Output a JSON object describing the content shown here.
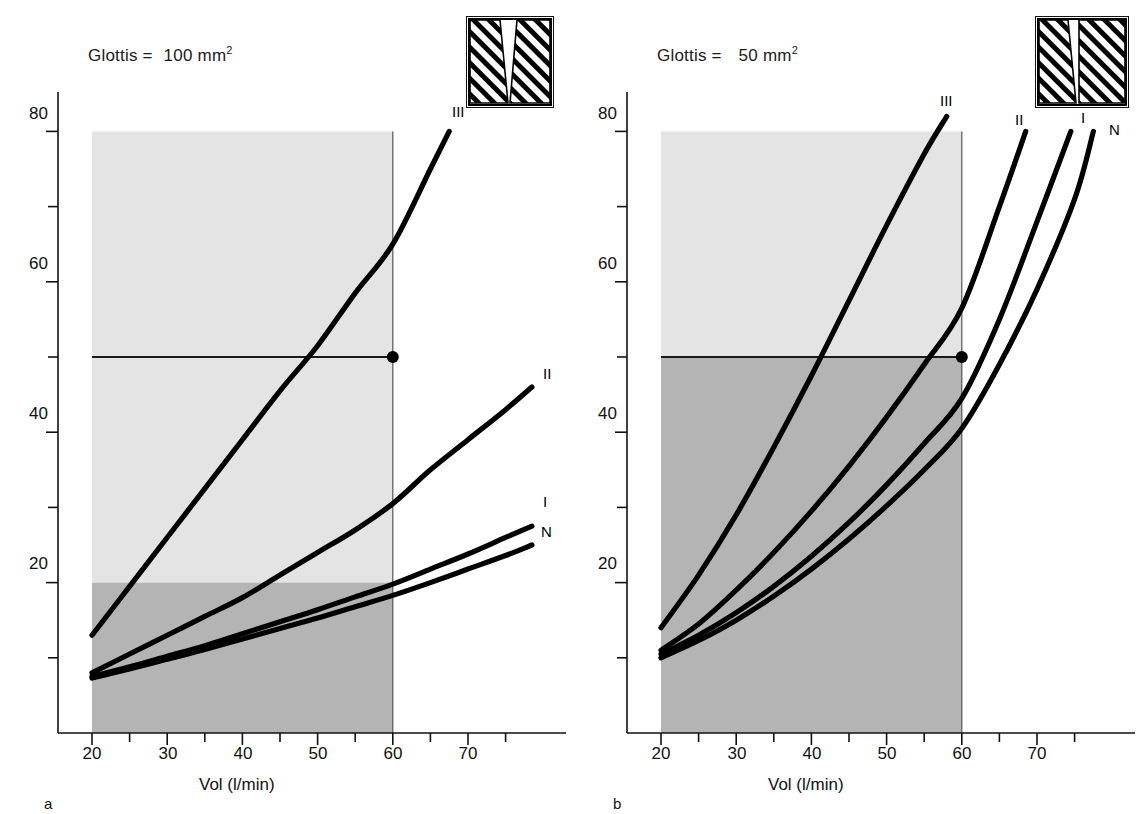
{
  "figure": {
    "panels": [
      {
        "id": "a",
        "panel_label": "a",
        "title_prefix": "Glottis =",
        "title_value": "100",
        "title_unit": "mm",
        "title_exponent": "2",
        "inset_name": "glottis-aperture-wide-triangular"
      },
      {
        "id": "b",
        "panel_label": "b",
        "title_prefix": "Glottis =",
        "title_value": "50",
        "title_unit": "mm",
        "title_exponent": "2",
        "inset_name": "glottis-aperture-narrow-slit"
      }
    ],
    "axis_x_label": "Vol  (l/min)",
    "axis_x_ticks": [
      "20",
      "30",
      "40",
      "50",
      "60",
      "70"
    ],
    "axis_y_ticks": [
      "20",
      "40",
      "60",
      "80"
    ],
    "curve_labels": [
      "III",
      "II",
      "I",
      "N"
    ]
  },
  "colors": {
    "curve": "#000000",
    "axis": "#111111",
    "band_light": "#e4e4e4",
    "band_dark": "#b4b4b4",
    "reference_line": "#1a1a1a",
    "marker": "#000000",
    "background": "#ffffff"
  },
  "chart_data": [
    {
      "type": "line",
      "title": "Glottis = 100 mm2",
      "panel": "a",
      "xlabel": "Vol  (l/min)",
      "ylabel": "",
      "xlim": [
        14,
        79
      ],
      "ylim": [
        0,
        86
      ],
      "xticks": [
        20,
        30,
        40,
        50,
        60,
        70
      ],
      "xticks_minor": [
        25,
        35,
        45,
        55,
        65,
        75
      ],
      "yticks": [
        20,
        40,
        60,
        80
      ],
      "yticks_minor": [
        10,
        30,
        50,
        70
      ],
      "grid": false,
      "legend": "inline-curve-labels",
      "bands": [
        {
          "name": "light-band",
          "x": [
            20,
            60
          ],
          "y": [
            20,
            80
          ],
          "color": "#e4e4e4"
        },
        {
          "name": "dark-band",
          "x": [
            20,
            60
          ],
          "y": [
            0,
            20
          ],
          "color": "#b4b4b4"
        }
      ],
      "reference_line": {
        "y": 50,
        "x_from": 20,
        "x_to": 60
      },
      "marker_point": {
        "x": 60,
        "y": 50
      },
      "series": [
        {
          "name": "III",
          "x": [
            20,
            25,
            30,
            35,
            40,
            45,
            50,
            55,
            60,
            65,
            67.5
          ],
          "y": [
            13,
            19.5,
            26,
            32.5,
            39,
            45.5,
            51.5,
            58.5,
            65,
            75,
            80
          ]
        },
        {
          "name": "II",
          "x": [
            20,
            25,
            30,
            35,
            40,
            45,
            50,
            55,
            60,
            65,
            70,
            75,
            78.5
          ],
          "y": [
            8,
            10.5,
            13,
            15.5,
            18,
            21,
            24,
            27,
            30.5,
            35,
            39,
            43,
            46
          ]
        },
        {
          "name": "I",
          "x": [
            20,
            25,
            30,
            35,
            40,
            45,
            50,
            55,
            60,
            65,
            70,
            75,
            78.5
          ],
          "y": [
            7.5,
            8.8,
            10.2,
            11.6,
            13.2,
            14.8,
            16.4,
            18.1,
            19.8,
            21.8,
            23.8,
            26,
            27.5
          ]
        },
        {
          "name": "N",
          "x": [
            20,
            25,
            30,
            35,
            40,
            45,
            50,
            55,
            60,
            65,
            70,
            75,
            78.5
          ],
          "y": [
            7.3,
            8.5,
            9.8,
            11.1,
            12.5,
            13.9,
            15.3,
            16.8,
            18.3,
            20,
            21.8,
            23.6,
            25
          ]
        }
      ]
    },
    {
      "type": "line",
      "title": "Glottis = 50 mm2",
      "panel": "b",
      "xlabel": "Vol  (l/min)",
      "ylabel": "",
      "xlim": [
        14,
        79
      ],
      "ylim": [
        0,
        86
      ],
      "xticks": [
        20,
        30,
        40,
        50,
        60,
        70
      ],
      "xticks_minor": [
        25,
        35,
        45,
        55,
        65,
        75
      ],
      "yticks": [
        20,
        40,
        60,
        80
      ],
      "yticks_minor": [
        10,
        30,
        50,
        70
      ],
      "grid": false,
      "legend": "inline-curve-labels",
      "bands": [
        {
          "name": "light-band",
          "x": [
            20,
            60
          ],
          "y": [
            50,
            80
          ],
          "color": "#e4e4e4"
        },
        {
          "name": "dark-band",
          "x": [
            20,
            60
          ],
          "y": [
            0,
            50
          ],
          "color": "#b4b4b4"
        }
      ],
      "reference_line": {
        "y": 50,
        "x_from": 20,
        "x_to": 60
      },
      "marker_point": {
        "x": 60,
        "y": 50
      },
      "series": [
        {
          "name": "III",
          "x": [
            20,
            25,
            30,
            35,
            40,
            45,
            50,
            55,
            58
          ],
          "y": [
            14,
            21,
            29,
            38,
            47.5,
            57.5,
            67.5,
            77,
            82
          ]
        },
        {
          "name": "II",
          "x": [
            20,
            25,
            30,
            35,
            40,
            45,
            50,
            55,
            60,
            65,
            68.5
          ],
          "y": [
            11,
            14.5,
            19,
            24,
            29.5,
            35.5,
            42,
            49,
            56.5,
            70,
            80
          ]
        },
        {
          "name": "I",
          "x": [
            20,
            25,
            30,
            35,
            40,
            45,
            50,
            55,
            60,
            65,
            70,
            74.5
          ],
          "y": [
            10.5,
            13,
            16,
            19.5,
            23.5,
            28,
            33,
            38.5,
            44.5,
            55,
            68,
            80
          ]
        },
        {
          "name": "N",
          "x": [
            20,
            25,
            30,
            35,
            40,
            45,
            50,
            55,
            60,
            65,
            70,
            75,
            77.5
          ],
          "y": [
            10,
            12.3,
            15,
            18.2,
            21.8,
            25.8,
            30.2,
            35,
            40.5,
            49,
            59,
            71,
            80
          ]
        }
      ]
    }
  ]
}
